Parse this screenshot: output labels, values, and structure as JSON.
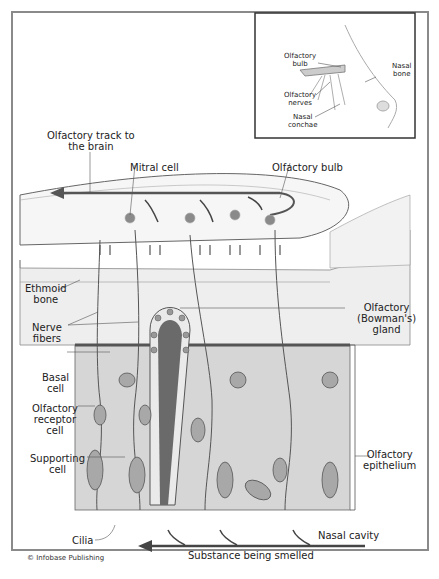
{
  "diagram": {
    "credit": "© Infobase Publishing",
    "inset": {
      "labels": {
        "olfactory_bulb": "Olfactory\nbulb",
        "olfactory_nerves": "Olfactory\nnerves",
        "nasal_conchae": "Nasal\nconchae",
        "nasal_bone": "Nasal\nbone"
      }
    },
    "labels": {
      "olfactory_track": "Olfactory track to\nthe brain",
      "mitral_cell": "Mitral cell",
      "olfactory_bulb": "Olfactory bulb",
      "ethmoid_bone": "Ethmoid\nbone",
      "nerve_fibers": "Nerve\nfibers",
      "bowmans_gland": "Olfactory\n(Bowman's)\ngland",
      "basal_cell": "Basal\ncell",
      "olfactory_receptor_cell": "Olfactory\nreceptor\ncell",
      "supporting_cell": "Supporting\ncell",
      "olfactory_epithelium": "Olfactory\nepithelium",
      "cilia": "Cilia",
      "nasal_cavity": "Nasal cavity",
      "substance": "Substance being smelled"
    },
    "colors": {
      "line": "#555555",
      "bulb_fill": "#f4f4f4",
      "epithelium_fill": "#d9d9d9",
      "gland_fill": "#6a6a6a",
      "nucleus": "#9a9a9a",
      "arrow": "#444444"
    }
  }
}
